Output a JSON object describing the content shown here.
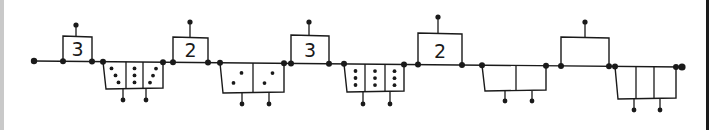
{
  "diagram": {
    "stroke_color": "#1a1a1a",
    "background": "#ffffff",
    "start_node": {
      "x": 34,
      "y": 61
    },
    "end_node": {
      "x": 682,
      "y": 67
    },
    "upper_boxes": [
      {
        "label": "3",
        "x1": 63,
        "x2": 92,
        "top": 36,
        "base": 61,
        "pin_x": 76,
        "pin_top": 25
      },
      {
        "label": "2",
        "x1": 173,
        "x2": 208,
        "top": 37,
        "base": 62,
        "pin_x": 190,
        "pin_top": 22
      },
      {
        "label": "3",
        "x1": 291,
        "x2": 329,
        "top": 35,
        "base": 62,
        "pin_x": 309,
        "pin_top": 22
      },
      {
        "label": "2",
        "x1": 418,
        "x2": 462,
        "top": 33,
        "base": 64,
        "pin_x": 438,
        "pin_top": 17
      },
      {
        "label": "",
        "x1": 561,
        "x2": 609,
        "top": 37,
        "base": 65,
        "pin_x": 585,
        "pin_top": 22
      }
    ],
    "lower_boxes": [
      {
        "x1": 103,
        "x2": 163,
        "base": 62,
        "bottom": 89,
        "dividers": [
          126,
          143
        ],
        "pins": [
          123,
          146
        ],
        "pin_bottom": 100,
        "cells": [
          {
            "dots": 3,
            "pattern": "diagonal"
          },
          {
            "dots": 3,
            "pattern": "vertical"
          },
          {
            "dots": 3,
            "pattern": "diagonal"
          }
        ]
      },
      {
        "x1": 220,
        "x2": 284,
        "base": 63,
        "bottom": 93,
        "dividers": [
          253
        ],
        "pins": [
          242,
          269
        ],
        "pin_bottom": 104,
        "cells": [
          {
            "dots": 2,
            "pattern": "diagonal"
          },
          {
            "dots": 2,
            "pattern": "diagonal"
          }
        ]
      },
      {
        "x1": 344,
        "x2": 404,
        "base": 63,
        "bottom": 92,
        "dividers": [
          365,
          385
        ],
        "pins": [
          363,
          390
        ],
        "pin_bottom": 104,
        "cells": [
          {
            "dots": 3,
            "pattern": "vertical"
          },
          {
            "dots": 3,
            "pattern": "vertical"
          },
          {
            "dots": 3,
            "pattern": "vertical"
          }
        ]
      },
      {
        "x1": 482,
        "x2": 546,
        "base": 65,
        "bottom": 91,
        "dividers": [
          516
        ],
        "pins": [
          505,
          532
        ],
        "pin_bottom": 101,
        "cells": [
          {
            "dots": 0
          },
          {
            "dots": 0
          }
        ]
      },
      {
        "x1": 615,
        "x2": 676,
        "base": 66,
        "bottom": 99,
        "dividers": [
          636,
          654
        ],
        "pins": [
          634,
          660
        ],
        "pin_bottom": 110,
        "cells": [
          {
            "dots": 0
          },
          {
            "dots": 0
          },
          {
            "dots": 0
          }
        ]
      }
    ]
  }
}
